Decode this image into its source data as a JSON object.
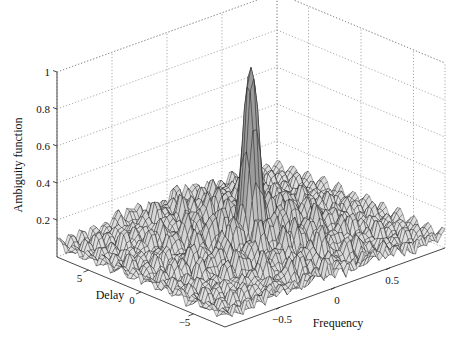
{
  "chart_data": {
    "type": "surface3d",
    "title": "",
    "xlabel": "Frequency",
    "ylabel": "Delay",
    "zlabel": "Ambiguity function",
    "xlim": [
      -1,
      1
    ],
    "ylim": [
      -8,
      8
    ],
    "zlim": [
      0,
      1
    ],
    "x_ticks": [
      -0.5,
      0,
      0.5
    ],
    "x_tick_labels": [
      "−0.5",
      "0",
      "0.5"
    ],
    "y_ticks": [
      5,
      0,
      -5
    ],
    "y_tick_labels": [
      "5",
      "0",
      "−5"
    ],
    "z_ticks": [
      0.2,
      0.4,
      0.6,
      0.8,
      1
    ],
    "z_tick_labels": [
      "0.2",
      "0.4",
      "0.6",
      "0.8",
      "1"
    ],
    "grid": true,
    "peak": {
      "frequency": 0,
      "delay": 0,
      "value": 1.0
    },
    "sidelobe_level_approx": 0.3,
    "colormap": "black wireframe mesh on white"
  }
}
